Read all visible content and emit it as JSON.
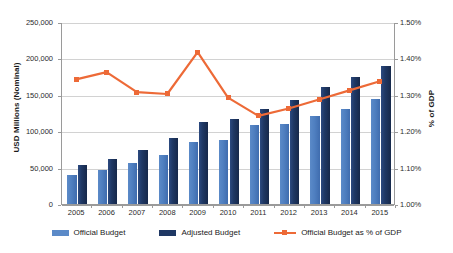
{
  "chart_data": {
    "type": "bar",
    "title": "",
    "subtitle": "",
    "categories": [
      "2005",
      "2006",
      "2007",
      "2008",
      "2009",
      "2010",
      "2011",
      "2012",
      "2013",
      "2014",
      "2015"
    ],
    "xlabel": "",
    "ylabel": "USD Millions (Nominal)",
    "y2label": "% of GDP",
    "ylim": [
      0,
      250000
    ],
    "y2lim": [
      1.0,
      1.5
    ],
    "grid": true,
    "legend_position": "bottom",
    "y_ticks": [
      "0",
      "50,000",
      "100,000",
      "150,000",
      "200,000",
      "250,000"
    ],
    "y_tick_values": [
      0,
      50000,
      100000,
      150000,
      200000,
      250000
    ],
    "y2_ticks": [
      "1.00%",
      "1.10%",
      "1.20%",
      "1.30%",
      "1.40%",
      "1.50%"
    ],
    "y2_tick_values": [
      1.0,
      1.1,
      1.2,
      1.3,
      1.4,
      1.5
    ],
    "series": [
      {
        "name": "Official Budget",
        "type": "bar",
        "axis": "left",
        "color": "#5b8ac8",
        "values": [
          40000,
          47000,
          56000,
          68000,
          85000,
          88000,
          108000,
          110000,
          121000,
          130000,
          144000
        ]
      },
      {
        "name": "Adjusted Budget",
        "type": "bar",
        "axis": "left",
        "color": "#1f3864",
        "values": [
          53000,
          62000,
          74000,
          91000,
          112000,
          117000,
          130000,
          143000,
          161000,
          174000,
          190000
        ]
      },
      {
        "name": "Official Budget as % of GDP",
        "type": "line",
        "axis": "right",
        "color": "#ed6a37",
        "values": [
          1.345,
          1.365,
          1.31,
          1.305,
          1.42,
          1.295,
          1.245,
          1.265,
          1.29,
          1.315,
          1.34
        ]
      }
    ]
  },
  "legend": {
    "items": [
      {
        "label": "Official Budget",
        "swatch": "bar-light-blue"
      },
      {
        "label": "Adjusted Budget",
        "swatch": "bar-dark-navy"
      },
      {
        "label": "Official Budget as % of GDP",
        "swatch": "line-orange-marker"
      }
    ]
  },
  "axes": {
    "left_title": "USD Millions (Nominal)",
    "right_title": "% of GDP"
  },
  "colors": {
    "official_budget": "#5b8ac8",
    "adjusted_budget": "#1f3864",
    "gdp_line": "#ed6a37",
    "gridline": "#d2d2d2",
    "axis": "#9a9a9a",
    "background": "#ffffff"
  }
}
